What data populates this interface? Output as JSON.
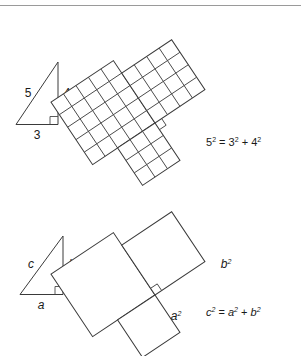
{
  "figure": {
    "top_rule": true,
    "panels": [
      {
        "id": "numeric",
        "triangle": {
          "name": "3-4-5 right triangle",
          "legs": [
            {
              "name": "base",
              "label": "3",
              "value": 3
            },
            {
              "name": "height",
              "label": "4",
              "value": 4
            }
          ],
          "hypotenuse": {
            "name": "hypotenuse",
            "label": "5",
            "value": 5
          },
          "right_angle_marker": true
        },
        "squares": [
          {
            "name": "hypotenuse-square",
            "label": "",
            "side": 5,
            "cells": 25,
            "grid": "5x5",
            "tilted": true
          },
          {
            "name": "vertical-leg-square",
            "label": "",
            "side": 4,
            "cells": 16,
            "grid": "4x4",
            "tilted": false
          },
          {
            "name": "horizontal-leg-square",
            "label": "",
            "side": 3,
            "cells": 9,
            "grid": "3x3",
            "tilted": false
          }
        ],
        "equation": {
          "name": "numeric-equation",
          "text": "5² = 3² + 4²",
          "parts": [
            {
              "base": "5",
              "exp": "2"
            },
            {
              "op": "="
            },
            {
              "base": "3",
              "exp": "2"
            },
            {
              "op": "+"
            },
            {
              "base": "4",
              "exp": "2"
            }
          ]
        }
      },
      {
        "id": "algebraic",
        "triangle": {
          "name": "abc right triangle",
          "legs": [
            {
              "name": "base",
              "label": "a"
            },
            {
              "name": "height",
              "label": "b"
            }
          ],
          "hypotenuse": {
            "name": "hypotenuse",
            "label": "c"
          },
          "right_angle_marker": true
        },
        "squares": [
          {
            "name": "hypotenuse-square",
            "label": "c",
            "exp": "2",
            "tilted": true
          },
          {
            "name": "vertical-leg-square",
            "label": "b",
            "exp": "2",
            "tilted": false
          },
          {
            "name": "horizontal-leg-square",
            "label": "a",
            "exp": "2",
            "tilted": false
          }
        ],
        "equation": {
          "name": "algebraic-equation",
          "text": "c² = a² + b²",
          "parts": [
            {
              "base": "c",
              "exp": "2"
            },
            {
              "op": "="
            },
            {
              "base": "a",
              "exp": "2"
            },
            {
              "op": "+"
            },
            {
              "base": "b",
              "exp": "2"
            }
          ]
        }
      }
    ],
    "colors": {
      "ink": "#3a3a3a",
      "text": "#1a1a1a",
      "rule": "#9a9a9a",
      "background": "#ffffff"
    }
  }
}
